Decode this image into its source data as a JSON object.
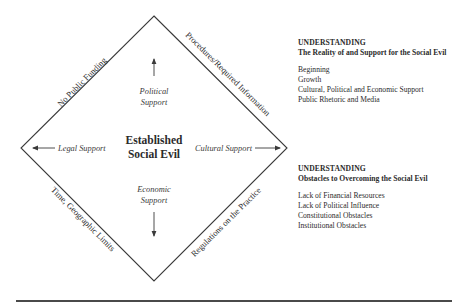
{
  "diagram": {
    "center_title": {
      "line1": "Established",
      "line2": "Social Evil"
    },
    "inner_labels": {
      "top": {
        "line1": "Political",
        "line2": "Support",
        "arrow": "up"
      },
      "bottom": {
        "line1": "Economic",
        "line2": "Support",
        "arrow": "down"
      },
      "left": {
        "text": "Legal Support",
        "arrow": "left"
      },
      "right": {
        "text": "Cultural Support",
        "arrow": "right"
      }
    },
    "edge_labels": {
      "top_left": "No Public Funding",
      "top_right": "Procedures/Required Information",
      "bottom_left": "Time, Geographic Limits",
      "bottom_right": "Regulations on the Practice"
    },
    "colors": {
      "line": "#3a3a3a",
      "text": "#2b2b2b",
      "background": "#ffffff"
    }
  },
  "side_panels": [
    {
      "heading": "UNDERSTANDING",
      "subheading": "The Reality of and Support for the Social Evil",
      "items": [
        "Beginning",
        "Growth",
        "Cultural, Political and Economic Support",
        "Public Rhetoric and Media"
      ]
    },
    {
      "heading": "UNDERSTANDING",
      "subheading": "Obstacles to Overcoming the Social Evil",
      "items": [
        "Lack of Financial Resources",
        "Lack of Political Influence",
        "Constitutional Obstacles",
        "Institutional Obstacles"
      ]
    }
  ]
}
